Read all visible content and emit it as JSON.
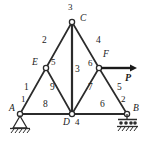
{
  "figure": {
    "type": "truss-diagram",
    "title": "",
    "colors": {
      "line": "#2b2b2b",
      "label": "#1a1a1a",
      "background": "#ffffff"
    }
  },
  "joints": [
    {
      "letter": "A",
      "number": "1",
      "x": 20,
      "y": 114,
      "support": "pin"
    },
    {
      "letter": "B",
      "number": "2",
      "x": 127,
      "y": 114,
      "support": "roller"
    },
    {
      "letter": "C",
      "number": "3",
      "x": 72,
      "y": 22,
      "support": "none"
    },
    {
      "letter": "D",
      "number": "4",
      "x": 72,
      "y": 114,
      "support": "none"
    },
    {
      "letter": "E",
      "number": "5",
      "x": 46,
      "y": 68,
      "support": "none"
    },
    {
      "letter": "F",
      "number": "6",
      "x": 99,
      "y": 68,
      "support": "none"
    }
  ],
  "members": [
    {
      "number": "1",
      "from": "A",
      "to": "E",
      "label_x": 26,
      "label_y": 88
    },
    {
      "number": "2",
      "from": "E",
      "to": "C",
      "label_x": 44,
      "label_y": 41
    },
    {
      "number": "3",
      "from": "C",
      "to": "D",
      "label_x": 75,
      "label_y": 70
    },
    {
      "number": "4",
      "from": "C",
      "to": "F",
      "label_x": 97,
      "label_y": 41
    },
    {
      "number": "5",
      "from": "F",
      "to": "B",
      "label_x": 118,
      "label_y": 88
    },
    {
      "number": "6",
      "from": "D",
      "to": "B",
      "label_x": 101,
      "label_y": 105
    },
    {
      "number": "7",
      "from": "F",
      "to": "D",
      "label_x": 89,
      "label_y": 88
    },
    {
      "number": "8",
      "from": "A",
      "to": "D",
      "label_x": 44,
      "label_y": 105
    },
    {
      "number": "9",
      "from": "E",
      "to": "D",
      "label_x": 51,
      "label_y": 88
    }
  ],
  "load": {
    "label": "P",
    "applied_at": "F",
    "direction": "right",
    "arrow_start_x": 101,
    "arrow_end_x": 136,
    "arrow_y": 68,
    "label_x": 126,
    "label_y": 78
  },
  "node_labels": [
    {
      "name": "joint-letter-A",
      "text": "A",
      "x": 9,
      "y": 110
    },
    {
      "name": "joint-number-A",
      "text": "1",
      "x": 21,
      "y": 98
    },
    {
      "name": "joint-letter-B",
      "text": "B",
      "x": 133,
      "y": 110
    },
    {
      "name": "joint-number-B",
      "text": "2",
      "x": 122,
      "y": 98
    },
    {
      "name": "joint-letter-C",
      "text": "C",
      "x": 80,
      "y": 20
    },
    {
      "name": "joint-number-C",
      "text": "3",
      "x": 68,
      "y": 8
    },
    {
      "name": "joint-letter-D",
      "text": "D",
      "x": 64,
      "y": 124
    },
    {
      "name": "joint-number-D",
      "text": "4",
      "x": 76,
      "y": 123
    },
    {
      "name": "joint-letter-E",
      "text": "E",
      "x": 33,
      "y": 64
    },
    {
      "name": "joint-number-E",
      "text": "5",
      "x": 51,
      "y": 62
    },
    {
      "name": "joint-letter-F",
      "text": "F",
      "x": 104,
      "y": 56
    },
    {
      "name": "joint-number-F",
      "text": "6",
      "x": 88,
      "y": 64
    }
  ]
}
